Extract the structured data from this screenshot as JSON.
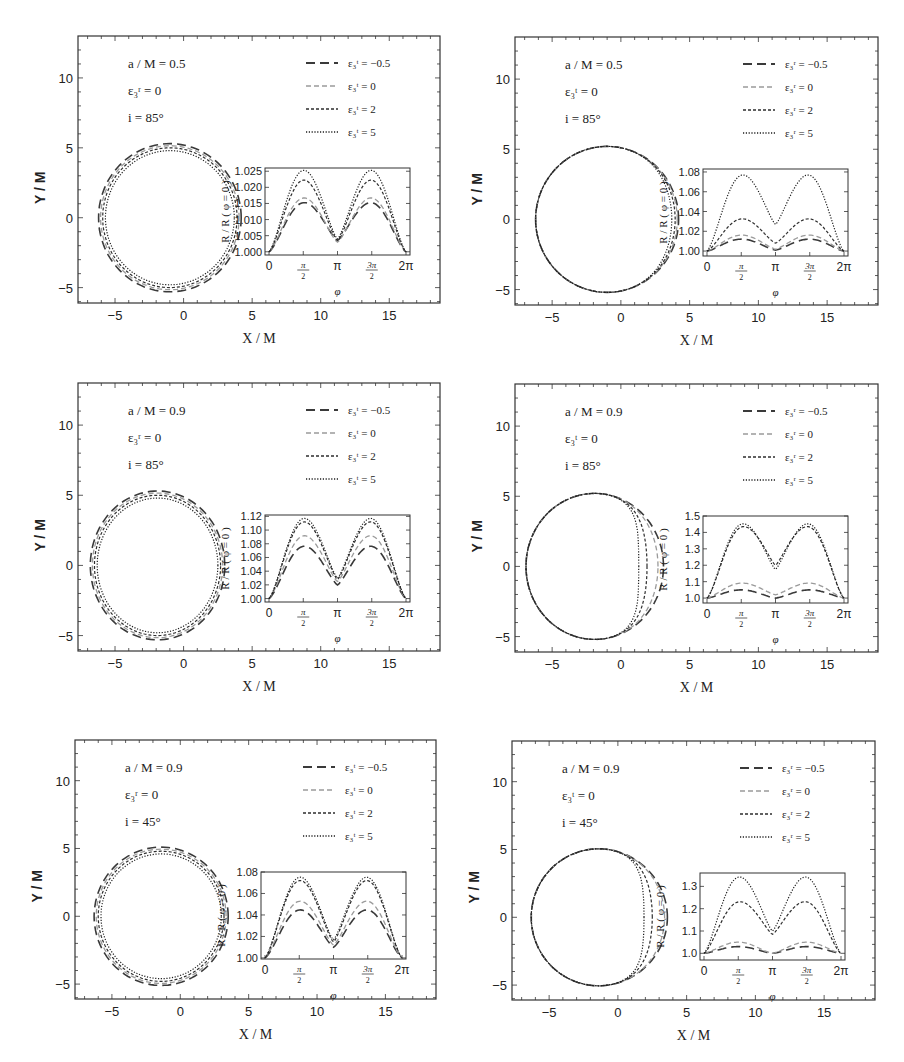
{
  "figure": {
    "header_fragment": "...ple, see the figure...",
    "panel_axes": {
      "xlabel": "X / M",
      "ylabel": "Y / M",
      "xticks": [
        -5,
        0,
        5,
        10,
        15
      ],
      "yticks": [
        -5,
        0,
        5,
        10
      ],
      "xlim": [
        -7.7,
        18.7
      ],
      "ylim": [
        -6.1,
        13
      ]
    },
    "inset_axes": {
      "xlabel": "φ",
      "ylabel": "R / R ( φ = 0 )",
      "xticks": [
        "0",
        "π/2",
        "π",
        "3π/2",
        "2π"
      ]
    },
    "legend_values": [
      "-0.5",
      "0",
      "2",
      "5"
    ],
    "line_styles": [
      "long-dash",
      "dash-light",
      "short-dash",
      "dotted"
    ]
  },
  "chart_data": [
    {
      "type": "line",
      "panel": "top-left",
      "title": "",
      "annotations": [
        "a / M = 0.5",
        "ε₃ʳ = 0",
        "i = 85°"
      ],
      "legend_param": "ε₃ᵗ",
      "legend": [
        "ε₃ᵗ = −0.5",
        "ε₃ᵗ = 0",
        "ε₃ᵗ = 2",
        "ε₃ᵗ = 5"
      ],
      "xlabel": "X / M",
      "ylabel": "Y / M",
      "xlim": [
        -7.7,
        18.7
      ],
      "ylim": [
        -6.1,
        13
      ],
      "curves": [
        {
          "name": "ε₃ᵗ = −0.5",
          "cx": -1.0,
          "cy": 0,
          "rx": 5.2,
          "ry": 5.3,
          "dent": 0
        },
        {
          "name": "ε₃ᵗ = 0",
          "cx": -1.0,
          "cy": 0,
          "rx": 5.05,
          "ry": 5.15,
          "dent": 0
        },
        {
          "name": "ε₃ᵗ = 2",
          "cx": -1.0,
          "cy": 0,
          "rx": 4.9,
          "ry": 5.0,
          "dent": 0
        },
        {
          "name": "ε₃ᵗ = 5",
          "cx": -1.0,
          "cy": 0,
          "rx": 4.7,
          "ry": 4.8,
          "dent": 0
        }
      ],
      "inset": {
        "ylim": [
          0.999,
          1.026
        ],
        "yticks": [
          "1.000",
          "1.005",
          "1.010",
          "1.015",
          "1.020",
          "1.025"
        ],
        "yticks_values": [
          1.0,
          1.005,
          1.01,
          1.015,
          1.02,
          1.025
        ],
        "series": [
          {
            "name": "ε₃ᵗ = −0.5",
            "peak": 1.015,
            "mid": 1.0035
          },
          {
            "name": "ε₃ᵗ = 0",
            "peak": 1.0165,
            "mid": 1.003
          },
          {
            "name": "ε₃ᵗ = 2",
            "peak": 1.022,
            "mid": 1.0035
          },
          {
            "name": "ε₃ᵗ = 5",
            "peak": 1.025,
            "mid": 1.004
          }
        ]
      }
    },
    {
      "type": "line",
      "panel": "top-right",
      "annotations": [
        "a / M = 0.5",
        "ε₃ᵗ = 0",
        "i = 85°"
      ],
      "legend_param": "ε₃ʳ",
      "legend": [
        "ε₃ʳ = −0.5",
        "ε₃ʳ = 0",
        "ε₃ʳ = 2",
        "ε₃ʳ = 5"
      ],
      "xlabel": "X / M",
      "ylabel": "Y / M",
      "xlim": [
        -7.7,
        18.7
      ],
      "ylim": [
        -6.1,
        13
      ],
      "curves": [
        {
          "name": "ε₃ʳ = −0.5",
          "cx": -1.0,
          "cy": 0,
          "rx": 5.2,
          "ry": 5.2,
          "right_x": 4.2
        },
        {
          "name": "ε₃ʳ = 0",
          "cx": -1.0,
          "cy": 0,
          "rx": 5.2,
          "ry": 5.2,
          "right_x": 4.1
        },
        {
          "name": "ε₃ʳ = 2",
          "cx": -1.0,
          "cy": 0,
          "rx": 5.2,
          "ry": 5.2,
          "right_x": 3.95
        },
        {
          "name": "ε₃ʳ = 5",
          "cx": -1.0,
          "cy": 0,
          "rx": 5.2,
          "ry": 5.2,
          "right_x": 3.7
        }
      ],
      "inset": {
        "ylim": [
          0.995,
          1.083
        ],
        "yticks": [
          "1.00",
          "1.02",
          "1.04",
          "1.06",
          "1.08"
        ],
        "yticks_values": [
          1.0,
          1.02,
          1.04,
          1.06,
          1.08
        ],
        "series": [
          {
            "name": "ε₃ʳ = −0.5",
            "peak": 1.012,
            "mid": 1.001
          },
          {
            "name": "ε₃ʳ = 0",
            "peak": 1.016,
            "mid": 1.002
          },
          {
            "name": "ε₃ʳ = 2",
            "peak": 1.032,
            "mid": 1.008
          },
          {
            "name": "ε₃ʳ = 5",
            "peak": 1.075,
            "mid": 1.027
          }
        ]
      }
    },
    {
      "type": "line",
      "panel": "middle-left",
      "annotations": [
        "a / M = 0.9",
        "ε₃ʳ = 0",
        "i = 85°"
      ],
      "legend_param": "ε₃ᵗ",
      "legend": [
        "ε₃ᵗ = −0.5",
        "ε₃ᵗ = 0",
        "ε₃ᵗ = 2",
        "ε₃ᵗ = 5"
      ],
      "xlabel": "X / M",
      "ylabel": "Y / M",
      "xlim": [
        -7.7,
        18.7
      ],
      "ylim": [
        -6.1,
        13
      ],
      "curves": [
        {
          "name": "ε₃ᵗ = −0.5",
          "cx": -1.9,
          "cy": 0,
          "rx": 4.9,
          "ry": 5.3
        },
        {
          "name": "ε₃ᵗ = 0",
          "cx": -1.9,
          "cy": 0,
          "rx": 4.75,
          "ry": 5.15
        },
        {
          "name": "ε₃ᵗ = 2",
          "cx": -1.9,
          "cy": 0,
          "rx": 4.6,
          "ry": 5.0
        },
        {
          "name": "ε₃ᵗ = 5",
          "cx": -1.9,
          "cy": 0,
          "rx": 4.4,
          "ry": 4.8
        }
      ],
      "inset": {
        "ylim": [
          0.995,
          1.122
        ],
        "yticks": [
          "1.00",
          "1.02",
          "1.04",
          "1.06",
          "1.08",
          "1.10",
          "1.12"
        ],
        "yticks_values": [
          1.0,
          1.02,
          1.04,
          1.06,
          1.08,
          1.1,
          1.12
        ],
        "series": [
          {
            "name": "ε₃ᵗ = −0.5",
            "peak": 1.075,
            "mid": 1.02
          },
          {
            "name": "ε₃ᵗ = 0",
            "peak": 1.09,
            "mid": 1.025
          },
          {
            "name": "ε₃ᵗ = 2",
            "peak": 1.11,
            "mid": 1.028
          },
          {
            "name": "ε₃ᵗ = 5",
            "peak": 1.115,
            "mid": 1.03
          }
        ]
      }
    },
    {
      "type": "line",
      "panel": "middle-right",
      "annotations": [
        "a / M = 0.9",
        "ε₃ᵗ = 0",
        "i = 85°"
      ],
      "legend_param": "ε₃ʳ",
      "legend": [
        "ε₃ʳ = −0.5",
        "ε₃ʳ = 0",
        "ε₃ʳ = 2",
        "ε₃ʳ = 5"
      ],
      "xlabel": "X / M",
      "ylabel": "Y / M",
      "xlim": [
        -7.7,
        18.7
      ],
      "ylim": [
        -6.1,
        13
      ],
      "curves": [
        {
          "name": "ε₃ʳ = −0.5",
          "cx": -1.9,
          "cy": 0,
          "rx": 5.0,
          "ry": 5.2,
          "right_x": 3.1
        },
        {
          "name": "ε₃ʳ = 0",
          "cx": -1.9,
          "cy": 0,
          "rx": 5.0,
          "ry": 5.2,
          "right_x": 2.7
        },
        {
          "name": "ε₃ʳ = 2",
          "cx": -1.9,
          "cy": 0,
          "rx": 5.0,
          "ry": 5.2,
          "right_x": 1.9
        },
        {
          "name": "ε₃ʳ = 5",
          "cx": -1.9,
          "cy": 0,
          "rx": 5.0,
          "ry": 5.2,
          "right_x": 1.3
        }
      ],
      "inset": {
        "ylim": [
          0.97,
          1.5
        ],
        "yticks": [
          "1.0",
          "1.1",
          "1.2",
          "1.3",
          "1.4",
          "1.5"
        ],
        "yticks_values": [
          1.0,
          1.1,
          1.2,
          1.3,
          1.4,
          1.5
        ],
        "series": [
          {
            "name": "ε₃ʳ = −0.5",
            "peak": 1.05,
            "mid": 1.0
          },
          {
            "name": "ε₃ʳ = 0",
            "peak": 1.09,
            "mid": 1.02
          },
          {
            "name": "ε₃ʳ = 2",
            "peak": 1.42,
            "mid": 1.2
          },
          {
            "name": "ε₃ʳ = 5",
            "peak": 1.44,
            "mid": 1.175
          }
        ]
      }
    },
    {
      "type": "line",
      "panel": "bottom-left",
      "annotations": [
        "a / M = 0.9",
        "ε₃ʳ = 0",
        "i = 45°"
      ],
      "legend_param": "ε₃ᵗ",
      "legend": [
        "ε₃ᵗ = −0.5",
        "ε₃ᵗ = 0",
        "ε₃ᵗ = 2",
        "ε₃ᵗ = 5"
      ],
      "xlabel": "X / M",
      "ylabel": "Y / M",
      "xlim": [
        -7.7,
        18.7
      ],
      "ylim": [
        -6.1,
        13
      ],
      "curves": [
        {
          "name": "ε₃ᵗ = −0.5",
          "cx": -1.4,
          "cy": 0,
          "rx": 4.9,
          "ry": 5.1
        },
        {
          "name": "ε₃ᵗ = 0",
          "cx": -1.4,
          "cy": 0,
          "rx": 4.75,
          "ry": 4.95
        },
        {
          "name": "ε₃ᵗ = 2",
          "cx": -1.4,
          "cy": 0,
          "rx": 4.6,
          "ry": 4.8
        },
        {
          "name": "ε₃ᵗ = 5",
          "cx": -1.4,
          "cy": 0,
          "rx": 4.4,
          "ry": 4.6
        }
      ],
      "inset": {
        "ylim": [
          0.999,
          1.08
        ],
        "yticks": [
          "1.00",
          "1.02",
          "1.04",
          "1.06",
          "1.08"
        ],
        "yticks_values": [
          1.0,
          1.02,
          1.04,
          1.06,
          1.08
        ],
        "series": [
          {
            "name": "ε₃ᵗ = −0.5",
            "peak": 1.044,
            "mid": 1.01
          },
          {
            "name": "ε₃ᵗ = 0",
            "peak": 1.052,
            "mid": 1.012
          },
          {
            "name": "ε₃ᵗ = 2",
            "peak": 1.071,
            "mid": 1.015
          },
          {
            "name": "ε₃ᵗ = 5",
            "peak": 1.074,
            "mid": 1.017
          }
        ]
      }
    },
    {
      "type": "line",
      "panel": "bottom-right",
      "annotations": [
        "a / M = 0.9",
        "ε₃ᵗ = 0",
        "i = 45°"
      ],
      "legend_param": "ε₃ʳ",
      "legend": [
        "ε₃ʳ = −0.5",
        "ε₃ʳ = 0",
        "ε₃ʳ = 2",
        "ε₃ʳ = 5"
      ],
      "xlabel": "X / M",
      "ylabel": "Y / M",
      "xlim": [
        -7.7,
        18.7
      ],
      "ylim": [
        -6.1,
        13
      ],
      "curves": [
        {
          "name": "ε₃ʳ = −0.5",
          "cx": -1.4,
          "cy": 0,
          "rx": 4.9,
          "ry": 5.05,
          "right_x": 3.6
        },
        {
          "name": "ε₃ʳ = 0",
          "cx": -1.4,
          "cy": 0,
          "rx": 4.9,
          "ry": 5.05,
          "right_x": 3.4
        },
        {
          "name": "ε₃ʳ = 2",
          "cx": -1.4,
          "cy": 0,
          "rx": 4.9,
          "ry": 5.05,
          "right_x": 2.5
        },
        {
          "name": "ε₃ʳ = 5",
          "cx": -1.4,
          "cy": 0,
          "rx": 4.9,
          "ry": 5.05,
          "right_x": 1.9
        }
      ],
      "inset": {
        "ylim": [
          0.97,
          1.36
        ],
        "yticks": [
          "1.0",
          "1.1",
          "1.2",
          "1.3"
        ],
        "yticks_values": [
          1.0,
          1.1,
          1.2,
          1.3
        ],
        "series": [
          {
            "name": "ε₃ʳ = −0.5",
            "peak": 1.03,
            "mid": 1.0
          },
          {
            "name": "ε₃ʳ = 0",
            "peak": 1.05,
            "mid": 1.0
          },
          {
            "name": "ε₃ʳ = 2",
            "peak": 1.225,
            "mid": 1.085
          },
          {
            "name": "ε₃ʳ = 5",
            "peak": 1.335,
            "mid": 1.1
          }
        ]
      }
    }
  ],
  "layout": {
    "panels": [
      {
        "x": 78,
        "y": 36,
        "w": 362,
        "h": 267
      },
      {
        "x": 515,
        "y": 37,
        "w": 363,
        "h": 268
      },
      {
        "x": 78,
        "y": 383,
        "w": 362,
        "h": 268
      },
      {
        "x": 515,
        "y": 384,
        "w": 363,
        "h": 268
      },
      {
        "x": 75,
        "y": 740,
        "w": 361,
        "h": 259
      },
      {
        "x": 512,
        "y": 741,
        "w": 363,
        "h": 259
      }
    ]
  }
}
